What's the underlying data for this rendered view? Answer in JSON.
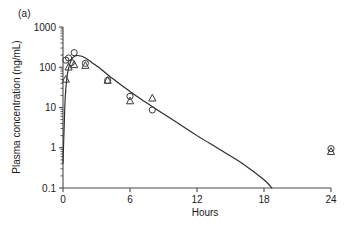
{
  "figure": {
    "panel_label": "(a)"
  },
  "chart_data": {
    "type": "line",
    "title": "",
    "subtitle": "",
    "xlabel": "Hours",
    "ylabel": "Plasma concentration (ng/mL)",
    "xlim": [
      0,
      24
    ],
    "ylim": [
      0.1,
      1000
    ],
    "yscale": "log",
    "xscale": "linear",
    "grid": false,
    "legend": "none",
    "xticks": [
      0,
      6,
      12,
      18,
      24
    ],
    "xtick_labels": [
      "0",
      "6",
      "12",
      "18",
      "24"
    ],
    "yticks": [
      0.1,
      1,
      10,
      100,
      1000
    ],
    "ytick_labels": [
      "0.1",
      "1",
      "10",
      "100",
      "1000"
    ],
    "series": [
      {
        "name": "observed-circles",
        "marker": "circle",
        "x": [
          0.25,
          0.5,
          0.75,
          1.0,
          2.0,
          4.0,
          6.0,
          8.0,
          24.0
        ],
        "y": [
          150,
          170,
          130,
          230,
          125,
          47,
          19,
          8.7,
          0.95
        ]
      },
      {
        "name": "observed-triangles",
        "marker": "triangle",
        "x": [
          0.25,
          0.5,
          1.0,
          2.0,
          4.0,
          6.0,
          8.0,
          24.0
        ],
        "y": [
          50,
          100,
          115,
          110,
          47,
          14.5,
          17,
          0.8
        ]
      },
      {
        "name": "fitted-curve",
        "marker": "none",
        "x": [
          0.0,
          0.1,
          0.2,
          0.35,
          0.5,
          0.7,
          0.9,
          1.2,
          1.6,
          2.0,
          2.6,
          3.2,
          4.0,
          5.0,
          6.0,
          7.0,
          8.0,
          10.0,
          12.0,
          14.0,
          16.0,
          18.0,
          18.7
        ],
        "y": [
          0.42,
          3.0,
          18,
          55,
          95,
          140,
          175,
          195,
          190,
          170,
          130,
          100,
          65,
          40,
          25,
          16,
          10.5,
          4.6,
          2.0,
          0.92,
          0.42,
          0.16,
          0.1
        ]
      }
    ]
  }
}
